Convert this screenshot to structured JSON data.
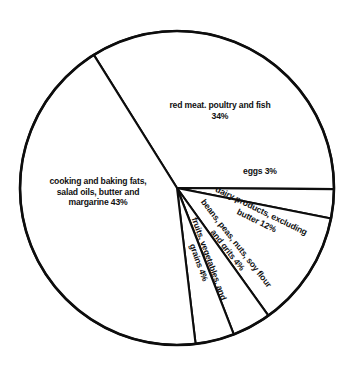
{
  "chart_data": {
    "type": "pie",
    "title": "",
    "subtitle": "",
    "xlabel": "",
    "ylabel": "",
    "legend": "none",
    "grid": false,
    "units": "percent",
    "start_angle_deg": 122,
    "direction": "clockwise",
    "center": {
      "x": 177,
      "y": 188
    },
    "radius": 157,
    "categories": [
      "red meat, poultry and fish",
      "eggs",
      "dairy products, excluding butter",
      "beans, peas, nuts, soy flour and grits",
      "fruits, vegetables, and grains",
      "cooking and baking fats, salad oils, butter and margarine"
    ],
    "values": [
      34,
      3,
      12,
      4,
      4,
      43
    ],
    "slices": [
      {
        "name": "red-meat",
        "label": "red meat. poultry and fish\n34%",
        "value": 34,
        "angle_deg": 122.4,
        "rotation_deg": 0
      },
      {
        "name": "eggs",
        "label": "eggs  3%",
        "value": 3,
        "angle_deg": 10.8,
        "rotation_deg": 0
      },
      {
        "name": "dairy",
        "label": "dairy products, excluding\nbutter  12%",
        "value": 12,
        "angle_deg": 43.2,
        "rotation_deg": 26
      },
      {
        "name": "beans",
        "label": "beans, peas, nuts, soy flour\nand grits 4%",
        "value": 4,
        "angle_deg": 14.4,
        "rotation_deg": 52
      },
      {
        "name": "fruits",
        "label": "fruits, vegetables, and\ngrains 4%",
        "value": 4,
        "angle_deg": 14.4,
        "rotation_deg": 70
      },
      {
        "name": "cooking-fats",
        "label": "cooking and baking fats,\nsalad oils, butter and\nmargarine 43%",
        "value": 43,
        "angle_deg": 154.8,
        "rotation_deg": 0
      }
    ],
    "colors": {
      "slice_fill": "#ffffff",
      "slice_stroke": "#0d0d0d",
      "label_text": "#111111",
      "background": "#ffffff"
    }
  }
}
